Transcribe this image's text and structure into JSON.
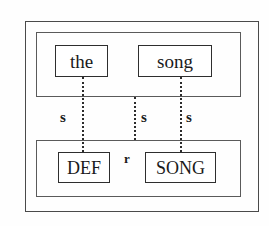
{
  "diagram": {
    "frames": [
      {
        "name": "outer-frame",
        "label": ""
      },
      {
        "name": "upper-tier",
        "label": ""
      },
      {
        "name": "lower-tier",
        "label": ""
      }
    ],
    "upper_tier": {
      "nodes": [
        {
          "id": "the",
          "text": "the"
        },
        {
          "id": "song",
          "text": "song"
        }
      ]
    },
    "lower_tier": {
      "nodes": [
        {
          "id": "def",
          "text": "DEF"
        },
        {
          "id": "song_feature",
          "text": "SONG"
        }
      ]
    },
    "association_labels": [
      {
        "id": "s1",
        "text": "s"
      },
      {
        "id": "s2",
        "text": "s"
      },
      {
        "id": "s3",
        "text": "s"
      }
    ],
    "relation_label": {
      "id": "r",
      "text": "r"
    },
    "colors": {
      "background": "#fefefe",
      "frame_stroke": "#4a4a4a",
      "tier_stroke": "#5a5a5a",
      "node_stroke": "#2e2e2e",
      "line_stroke": "#2b2b2b",
      "text": "#1a1a1a"
    }
  }
}
